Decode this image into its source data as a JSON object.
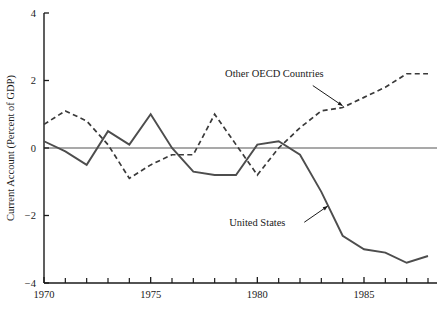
{
  "chart_data": {
    "type": "line",
    "title": "",
    "subtitle": "",
    "xlabel": "",
    "ylabel": "Current Account (Percent of GDP)",
    "xlim": [
      1970,
      1988
    ],
    "ylim": [
      -4,
      4
    ],
    "grid": false,
    "legend_position": "inline-annotations",
    "x_ticks_major": [
      1970,
      1975,
      1980,
      1985
    ],
    "x_tick_labels": [
      "1970",
      "1975",
      "1980",
      "1985"
    ],
    "x_ticks_minor": [
      1971,
      1972,
      1973,
      1974,
      1976,
      1977,
      1978,
      1979,
      1981,
      1982,
      1983,
      1984,
      1986,
      1987,
      1988
    ],
    "y_ticks": [
      4,
      2,
      0,
      -2,
      -4
    ],
    "y_tick_labels": [
      "4",
      "2",
      "0",
      "−2",
      "−4"
    ],
    "zero_line": 0,
    "x": [
      1970,
      1971,
      1972,
      1973,
      1974,
      1975,
      1976,
      1977,
      1978,
      1979,
      1980,
      1981,
      1982,
      1983,
      1984,
      1985,
      1986,
      1987,
      1988
    ],
    "series": [
      {
        "name": "United States",
        "style": "solid",
        "color": "#4d4d4d",
        "label_text": "United States",
        "values": [
          0.2,
          -0.1,
          -0.5,
          0.5,
          0.1,
          1.0,
          0.0,
          -0.7,
          -0.8,
          -0.8,
          0.1,
          0.2,
          -0.2,
          -1.3,
          -2.6,
          -3.0,
          -3.1,
          -3.4,
          -3.2
        ]
      },
      {
        "name": "Other OECD Countries",
        "style": "dashed",
        "color": "#3a3a3a",
        "label_text": "Other OECD Countries",
        "values": [
          0.7,
          1.1,
          0.8,
          0.1,
          -0.9,
          -0.5,
          -0.2,
          -0.2,
          1.0,
          0.1,
          -0.8,
          0.0,
          0.6,
          1.1,
          1.2,
          1.5,
          1.8,
          2.2,
          2.2
        ]
      }
    ],
    "annotations": [
      {
        "name": "other-oecd-countries-label",
        "text": "Other OECD Countries",
        "x": 1980.8,
        "y": 2.1,
        "leader_from": {
          "x": 1982.6,
          "y": 1.85
        },
        "leader_to": {
          "x": 1984.0,
          "y": 1.25
        }
      },
      {
        "name": "united-states-label",
        "text": "United States",
        "x": 1980.0,
        "y": -2.3,
        "leader_from": {
          "x": 1982.2,
          "y": -2.2
        },
        "leader_to": {
          "x": 1983.3,
          "y": -1.72
        }
      }
    ],
    "colors": {
      "axis": "#1a1a1a",
      "united_states": "#4d4d4d",
      "other_oecd": "#3a3a3a",
      "background": "#ffffff"
    }
  }
}
